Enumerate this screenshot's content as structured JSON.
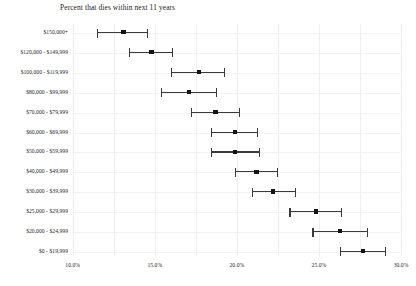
{
  "chart_data": {
    "type": "scatter",
    "title": "Percent that dies within next 11 years",
    "xlabel": "",
    "ylabel": "",
    "orientation": "horizontal",
    "grid": true,
    "legend": null,
    "xlim": [
      10.0,
      30.0
    ],
    "xticks": [
      10.0,
      15.0,
      20.0,
      25.0,
      30.0
    ],
    "xtick_labels": [
      "10.0%",
      "15.0%",
      "20.0%",
      "25.0%",
      "30.0%"
    ],
    "minor_gridlines": [
      10.0,
      12.5,
      15.0,
      17.5,
      20.0,
      22.5,
      25.0,
      27.5,
      30.0
    ],
    "categories": [
      "$150,000+",
      "$120,000 - $149,999",
      "$100,000 - $119,999",
      "$80,000 - $99,999",
      "$70,000 - $79,999",
      "$60,000 - $69,999",
      "$50,000 - $59,999",
      "$40,000 - $49,999",
      "$30,000 - $39,999",
      "$25,000 - $29,999",
      "$20,000 - $24,999",
      "$0 - $19,999"
    ],
    "values": [
      13.1,
      14.8,
      17.7,
      17.1,
      18.7,
      19.9,
      19.9,
      21.2,
      22.2,
      24.8,
      26.3,
      27.7
    ],
    "ci_low": [
      11.5,
      13.4,
      16.0,
      15.4,
      17.2,
      18.4,
      18.4,
      19.9,
      20.9,
      23.2,
      24.6,
      26.3
    ],
    "ci_high": [
      14.6,
      16.1,
      19.3,
      18.8,
      20.2,
      21.3,
      21.4,
      22.5,
      23.6,
      26.4,
      28.0,
      29.1
    ]
  }
}
